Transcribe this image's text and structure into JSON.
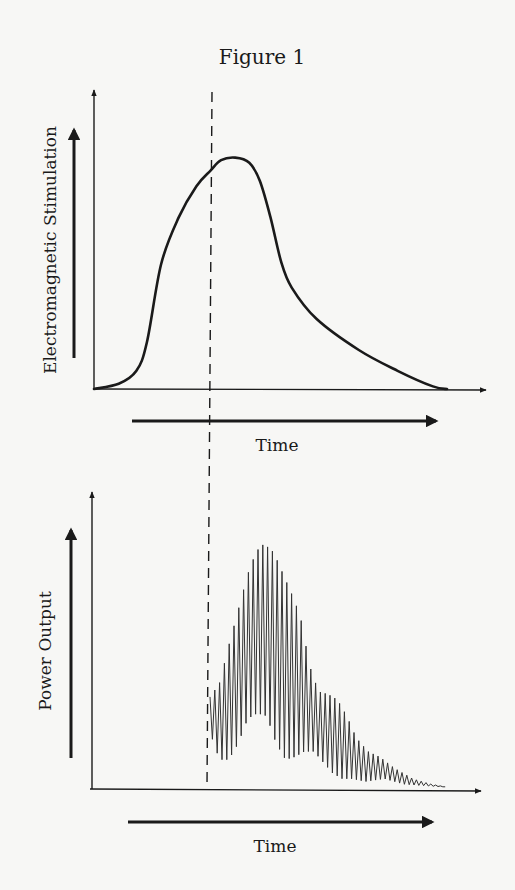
{
  "figure": {
    "title": "Figure 1",
    "background": "#f7f7f5",
    "ink_color": "#1a1a1a",
    "dashed_marker": {
      "description": "vertical dashed line marking the onset of power output",
      "x_top": 212,
      "x_bottom": 207,
      "y_top": 92,
      "y_bottom": 786
    }
  },
  "chart_data": [
    {
      "type": "line",
      "title": "",
      "xlabel": "Time",
      "ylabel": "Electromagnetic Stimulation",
      "xlim": [
        0,
        1
      ],
      "ylim": [
        0,
        1
      ],
      "grid": false,
      "legend": null,
      "ticks": "none",
      "annotations": [
        "dashed vertical line at t≈0.33 (onset marker)"
      ],
      "x": [
        0.0,
        0.07,
        0.12,
        0.15,
        0.19,
        0.24,
        0.29,
        0.33,
        0.36,
        0.4,
        0.44,
        0.47,
        0.5,
        0.53,
        0.56,
        0.63,
        0.75,
        0.86,
        0.96,
        1.0
      ],
      "values": [
        0.0,
        0.02,
        0.07,
        0.18,
        0.48,
        0.66,
        0.78,
        0.84,
        0.88,
        0.89,
        0.87,
        0.8,
        0.66,
        0.49,
        0.39,
        0.27,
        0.15,
        0.07,
        0.01,
        0.0
      ],
      "layout": {
        "origin": [
          94,
          389
        ],
        "x_axis_end": 486,
        "y_axis_top": 88,
        "plot_x_end": 447,
        "plot_height": 260,
        "label_arrow_x": {
          "x1": 132,
          "x2": 438,
          "y": 421
        },
        "label_arrow_y": {
          "x": 74,
          "y1": 358,
          "y2": 128
        },
        "xlabel_pos": [
          277,
          451
        ],
        "ylabel_pos": [
          60,
          250
        ]
      }
    },
    {
      "type": "line",
      "title": "",
      "xlabel": "Time",
      "ylabel": "Power Output",
      "xlim": [
        0,
        1
      ],
      "ylim": [
        0,
        1
      ],
      "grid": false,
      "legend": null,
      "ticks": "none",
      "annotations": [
        "high-frequency oscillation begins at dashed line; envelope peaks then decays with a secondary shoulder"
      ],
      "oscillation": {
        "start_x": 210,
        "end_x": 446,
        "period_px": 4.8,
        "peak_envelope": [
          [
            0.0,
            0.33
          ],
          [
            0.04,
            0.38
          ],
          [
            0.08,
            0.52
          ],
          [
            0.12,
            0.65
          ],
          [
            0.16,
            0.78
          ],
          [
            0.19,
            0.85
          ],
          [
            0.21,
            0.88
          ],
          [
            0.23,
            0.89
          ],
          [
            0.27,
            0.86
          ],
          [
            0.31,
            0.78
          ],
          [
            0.36,
            0.68
          ],
          [
            0.39,
            0.6
          ],
          [
            0.42,
            0.45
          ],
          [
            0.46,
            0.35
          ],
          [
            0.5,
            0.34
          ],
          [
            0.54,
            0.32
          ],
          [
            0.58,
            0.26
          ],
          [
            0.62,
            0.18
          ],
          [
            0.67,
            0.13
          ],
          [
            0.72,
            0.11
          ],
          [
            0.78,
            0.07
          ],
          [
            0.86,
            0.03
          ],
          [
            0.94,
            0.01
          ],
          [
            1.0,
            0.0
          ]
        ],
        "trough_envelope": [
          [
            0.0,
            0.2
          ],
          [
            0.04,
            0.1
          ],
          [
            0.08,
            0.1
          ],
          [
            0.12,
            0.16
          ],
          [
            0.16,
            0.25
          ],
          [
            0.2,
            0.27
          ],
          [
            0.24,
            0.26
          ],
          [
            0.28,
            0.16
          ],
          [
            0.32,
            0.1
          ],
          [
            0.36,
            0.11
          ],
          [
            0.4,
            0.13
          ],
          [
            0.44,
            0.13
          ],
          [
            0.48,
            0.09
          ],
          [
            0.52,
            0.05
          ],
          [
            0.56,
            0.03
          ],
          [
            0.6,
            0.03
          ],
          [
            0.66,
            0.02
          ],
          [
            0.74,
            0.03
          ],
          [
            0.82,
            0.01
          ],
          [
            0.9,
            0.005
          ],
          [
            1.0,
            0.0
          ]
        ]
      },
      "layout": {
        "origin": [
          90,
          789
        ],
        "x_axis_end": 481,
        "y_axis_top": 490,
        "plot_height": 260,
        "label_arrow_x": {
          "x1": 128,
          "x2": 434,
          "y": 822
        },
        "label_arrow_y": {
          "x": 71,
          "y1": 758,
          "y2": 528
        },
        "xlabel_pos": [
          275,
          852
        ],
        "ylabel_pos": [
          55,
          651
        ]
      }
    }
  ]
}
